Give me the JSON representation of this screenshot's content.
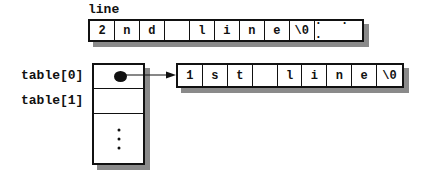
{
  "line_array": {
    "label": "line",
    "cells": [
      "2",
      "n",
      "d",
      "",
      "l",
      "i",
      "n",
      "e",
      "\\0",
      "· · ·"
    ]
  },
  "table": {
    "labels": [
      "table[0]",
      "table[1]"
    ],
    "rows": [
      "pointer",
      "",
      "⋮"
    ]
  },
  "first_line_array": {
    "cells": [
      "1",
      "s",
      "t",
      "",
      "l",
      "i",
      "n",
      "e",
      "\\0"
    ]
  },
  "colors": {
    "stroke": "#111111",
    "shadow": "#8a8a8a",
    "background": "#ffffff"
  }
}
